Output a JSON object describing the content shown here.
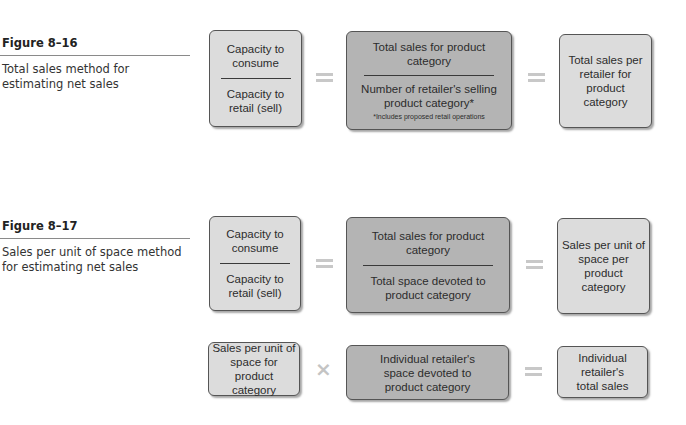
{
  "figures": [
    {
      "number": "Figure 8–16",
      "caption": "Total sales method for estimating net sales",
      "equation": {
        "left": {
          "numerator": "Capacity to consume",
          "denominator": "Capacity to retail (sell)"
        },
        "operator1": "equals",
        "middle": {
          "numerator": "Total sales for product category",
          "denominator": "Number of retailer's selling product category*",
          "footnote": "*Includes proposed retail operations"
        },
        "operator2": "equals",
        "result": "Total sales per retailer for product category"
      }
    },
    {
      "number": "Figure 8–17",
      "caption": "Sales per unit of space method for estimating net sales",
      "equation": {
        "left": {
          "numerator": "Capacity to consume",
          "denominator": "Capacity to retail (sell)"
        },
        "operator1": "equals",
        "middle": {
          "numerator": "Total sales for product category",
          "denominator": "Total space devoted to product category"
        },
        "operator2": "equals",
        "result": "Sales per unit of space per product category"
      },
      "equation2": {
        "left": "Sales per unit of space for product category",
        "operator1": "times",
        "middle": "Individual retailer's space devoted to product category",
        "operator2": "equals",
        "result": "Individual retailer's total sales"
      }
    }
  ],
  "colors": {
    "light_box": "#dcdcdc",
    "dark_box": "#b4b4b4",
    "operator": "#c8c8c8"
  }
}
